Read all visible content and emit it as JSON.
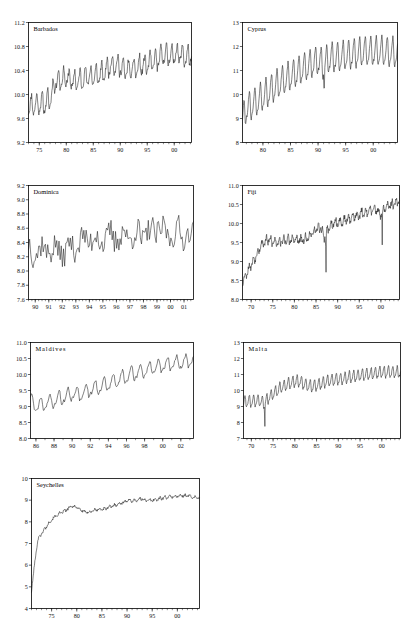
{
  "figure": {
    "title": "",
    "panel_count": 7,
    "line_color": "#1a1a1a",
    "axis_color": "#000000",
    "background": "#ffffff"
  },
  "chart_data": [
    {
      "type": "line",
      "title": "Barbados",
      "xlabel": "",
      "ylabel": "",
      "xlim": [
        73.0,
        103.2
      ],
      "ylim": [
        9.2,
        11.2
      ],
      "grid": false,
      "legend": null,
      "y_ticks": [
        "9.2",
        "9.6",
        "10.0",
        "10.4",
        "10.8",
        "11.2"
      ],
      "y_tick_values": [
        9.2,
        9.6,
        10.0,
        10.4,
        10.8,
        11.2
      ],
      "x_ticks": [
        "75",
        "80",
        "85",
        "90",
        "95",
        "00"
      ],
      "x_tick_values": [
        75,
        80,
        85,
        90,
        95,
        100
      ],
      "x_minor_step": 1,
      "series_name": "Barbados tourist arrivals (log)",
      "seasonal_period": 12,
      "points_per_unit": 12,
      "x_start": 73.0,
      "trend": [
        [
          73.0,
          9.8
        ],
        [
          74.0,
          9.82
        ],
        [
          75.0,
          9.85
        ],
        [
          76.0,
          9.84
        ],
        [
          77.0,
          9.92
        ],
        [
          78.0,
          10.22
        ],
        [
          79.0,
          10.25
        ],
        [
          80.0,
          10.28
        ],
        [
          81.0,
          10.22
        ],
        [
          82.0,
          10.22
        ],
        [
          83.0,
          10.26
        ],
        [
          84.0,
          10.3
        ],
        [
          85.0,
          10.3
        ],
        [
          86.0,
          10.32
        ],
        [
          87.0,
          10.36
        ],
        [
          88.0,
          10.48
        ],
        [
          89.0,
          10.5
        ],
        [
          90.0,
          10.46
        ],
        [
          91.0,
          10.4
        ],
        [
          92.0,
          10.42
        ],
        [
          93.0,
          10.44
        ],
        [
          94.0,
          10.48
        ],
        [
          95.0,
          10.5
        ],
        [
          96.0,
          10.54
        ],
        [
          97.0,
          10.58
        ],
        [
          98.0,
          10.66
        ],
        [
          99.0,
          10.64
        ],
        [
          100.0,
          10.66
        ],
        [
          101.0,
          10.68
        ],
        [
          102.0,
          10.62
        ],
        [
          103.2,
          10.64
        ]
      ],
      "amplitude": 0.3,
      "noise": 0.055,
      "seed": 11
    },
    {
      "type": "line",
      "title": "Cyprus",
      "xlabel": "",
      "ylabel": "",
      "xlim": [
        76.3,
        104.4
      ],
      "ylim": [
        8,
        13
      ],
      "grid": false,
      "legend": null,
      "y_ticks": [
        "8",
        "9",
        "10",
        "11",
        "12",
        "13"
      ],
      "y_tick_values": [
        8,
        9,
        10,
        11,
        12,
        13
      ],
      "x_ticks": [
        "80",
        "85",
        "90",
        "95",
        "00"
      ],
      "x_tick_values": [
        80,
        85,
        90,
        95,
        100
      ],
      "x_minor_step": 1,
      "series_name": "Cyprus tourist arrivals (log)",
      "seasonal_period": 12,
      "points_per_unit": 12,
      "x_start": 76.3,
      "trend": [
        [
          76.3,
          8.9
        ],
        [
          77.0,
          9.4
        ],
        [
          78.0,
          9.55
        ],
        [
          79.0,
          9.7
        ],
        [
          80.0,
          9.9
        ],
        [
          81.0,
          10.1
        ],
        [
          82.0,
          10.28
        ],
        [
          83.0,
          10.45
        ],
        [
          84.0,
          10.6
        ],
        [
          85.0,
          10.75
        ],
        [
          86.0,
          10.88
        ],
        [
          87.0,
          11.0
        ],
        [
          88.0,
          11.15
        ],
        [
          89.0,
          11.28
        ],
        [
          90.0,
          11.4
        ],
        [
          91.0,
          11.2
        ],
        [
          92.0,
          11.48
        ],
        [
          93.0,
          11.52
        ],
        [
          94.0,
          11.56
        ],
        [
          95.0,
          11.6
        ],
        [
          96.0,
          11.64
        ],
        [
          97.0,
          11.68
        ],
        [
          98.0,
          11.76
        ],
        [
          99.0,
          11.78
        ],
        [
          100.0,
          11.76
        ],
        [
          101.0,
          11.78
        ],
        [
          102.0,
          11.76
        ],
        [
          103.0,
          11.72
        ],
        [
          104.4,
          11.74
        ]
      ],
      "amplitude": 1.1,
      "noise": 0.05,
      "seed": 23,
      "annotations": [
        {
          "x": 91.1,
          "y": 9.7,
          "note": "1991 Gulf War dip"
        }
      ]
    },
    {
      "type": "line",
      "title": "Dominica",
      "xlabel": "",
      "ylabel": "",
      "xlim": [
        89.5,
        101.7
      ],
      "ylim": [
        7.6,
        9.2
      ],
      "grid": false,
      "legend": null,
      "y_ticks": [
        "7.6",
        "7.8",
        "8.0",
        "8.2",
        "8.4",
        "8.6",
        "8.8",
        "9.0",
        "9.2"
      ],
      "y_tick_values": [
        7.6,
        7.8,
        8.0,
        8.2,
        8.4,
        8.6,
        8.8,
        9.0,
        9.2
      ],
      "x_ticks": [
        "90",
        "91",
        "92",
        "93",
        "94",
        "95",
        "96",
        "97",
        "98",
        "99",
        "00",
        "01"
      ],
      "x_tick_values": [
        90,
        91,
        92,
        93,
        94,
        95,
        96,
        97,
        98,
        99,
        100,
        101
      ],
      "x_minor_step": 0.25,
      "series_name": "Dominica tourist arrivals (log)",
      "seasonal_period": 12,
      "points_per_unit": 12,
      "x_start": 89.5,
      "trend": [
        [
          89.5,
          8.3
        ],
        [
          90.0,
          8.28
        ],
        [
          91.0,
          8.32
        ],
        [
          92.0,
          8.26
        ],
        [
          93.0,
          8.38
        ],
        [
          94.0,
          8.46
        ],
        [
          95.0,
          8.44
        ],
        [
          96.0,
          8.48
        ],
        [
          97.0,
          8.5
        ],
        [
          98.0,
          8.5
        ],
        [
          99.0,
          8.58
        ],
        [
          100.0,
          8.52
        ],
        [
          101.7,
          8.52
        ]
      ],
      "amplitude": 0.17,
      "noise": 0.175,
      "seed": 37
    },
    {
      "type": "line",
      "title": "Fiji",
      "xlabel": "",
      "ylabel": "",
      "xlim": [
        68.0,
        104.3
      ],
      "ylim": [
        8.0,
        11.0
      ],
      "grid": false,
      "legend": null,
      "y_ticks": [
        "8.0",
        "8.5",
        "9.0",
        "9.5",
        "10.0",
        "10.5",
        "11.0"
      ],
      "y_tick_values": [
        8.0,
        8.5,
        9.0,
        9.5,
        10.0,
        10.5,
        11.0
      ],
      "x_ticks": [
        "70",
        "75",
        "80",
        "85",
        "90",
        "95",
        "00"
      ],
      "x_tick_values": [
        70,
        75,
        80,
        85,
        90,
        95,
        100
      ],
      "x_minor_step": 1,
      "series_name": "Fiji tourist arrivals (log)",
      "seasonal_period": 12,
      "points_per_unit": 12,
      "x_start": 68.0,
      "trend": [
        [
          68.0,
          8.45
        ],
        [
          69.0,
          8.72
        ],
        [
          70.0,
          8.92
        ],
        [
          71.0,
          9.12
        ],
        [
          72.0,
          9.38
        ],
        [
          73.0,
          9.52
        ],
        [
          74.0,
          9.56
        ],
        [
          75.0,
          9.52
        ],
        [
          76.0,
          9.52
        ],
        [
          77.0,
          9.54
        ],
        [
          78.0,
          9.56
        ],
        [
          79.0,
          9.56
        ],
        [
          80.0,
          9.58
        ],
        [
          81.0,
          9.56
        ],
        [
          82.0,
          9.56
        ],
        [
          83.0,
          9.62
        ],
        [
          84.0,
          9.72
        ],
        [
          85.0,
          9.82
        ],
        [
          86.0,
          9.92
        ],
        [
          87.0,
          9.62
        ],
        [
          88.0,
          9.92
        ],
        [
          89.0,
          9.98
        ],
        [
          90.0,
          10.02
        ],
        [
          91.0,
          10.04
        ],
        [
          92.0,
          10.1
        ],
        [
          93.0,
          10.14
        ],
        [
          94.0,
          10.2
        ],
        [
          95.0,
          10.24
        ],
        [
          96.0,
          10.28
        ],
        [
          97.0,
          10.32
        ],
        [
          98.0,
          10.34
        ],
        [
          99.0,
          10.38
        ],
        [
          100.0,
          10.22
        ],
        [
          101.0,
          10.42
        ],
        [
          102.0,
          10.46
        ],
        [
          103.0,
          10.52
        ],
        [
          104.3,
          10.58
        ]
      ],
      "amplitude": 0.17,
      "noise": 0.075,
      "seed": 53,
      "annotations": [
        {
          "x": 87.3,
          "y": 8.5,
          "note": "1987 coup collapse"
        },
        {
          "x": 100.3,
          "y": 9.4,
          "note": "2000 coup dip"
        }
      ]
    },
    {
      "type": "line",
      "title": "Maldives",
      "xlabel": "",
      "ylabel": "",
      "xlim": [
        85.4,
        103.4
      ],
      "ylim": [
        8.0,
        11.0
      ],
      "grid": false,
      "legend": null,
      "y_ticks": [
        "8.0",
        "8.5",
        "9.0",
        "9.5",
        "10.0",
        "10.5",
        "11.0"
      ],
      "y_tick_values": [
        8.0,
        8.5,
        9.0,
        9.5,
        10.0,
        10.5,
        11.0
      ],
      "x_ticks": [
        "86",
        "88",
        "90",
        "92",
        "94",
        "96",
        "98",
        "00",
        "02"
      ],
      "x_tick_values": [
        86,
        88,
        90,
        92,
        94,
        96,
        98,
        100,
        102
      ],
      "x_minor_step": 1,
      "series_name": "Maldives tourist arrivals (log)",
      "seasonal_period": 12,
      "points_per_unit": 12,
      "x_start": 85.4,
      "trend": [
        [
          85.4,
          9.2
        ],
        [
          86.0,
          9.0
        ],
        [
          87.0,
          9.08
        ],
        [
          88.0,
          9.18
        ],
        [
          89.0,
          9.28
        ],
        [
          90.0,
          9.38
        ],
        [
          91.0,
          9.4
        ],
        [
          92.0,
          9.52
        ],
        [
          93.0,
          9.62
        ],
        [
          94.0,
          9.7
        ],
        [
          95.0,
          9.82
        ],
        [
          96.0,
          9.94
        ],
        [
          97.0,
          10.04
        ],
        [
          98.0,
          10.12
        ],
        [
          99.0,
          10.2
        ],
        [
          100.0,
          10.28
        ],
        [
          101.0,
          10.34
        ],
        [
          102.0,
          10.36
        ],
        [
          103.4,
          10.46
        ]
      ],
      "amplitude": 0.4,
      "noise": 0.05,
      "seed": 71
    },
    {
      "type": "line",
      "title": "Malta",
      "xlabel": "",
      "ylabel": "",
      "xlim": [
        68.2,
        104.3
      ],
      "ylim": [
        7,
        13
      ],
      "grid": false,
      "legend": null,
      "y_ticks": [
        "7",
        "8",
        "9",
        "10",
        "11",
        "12",
        "13"
      ],
      "y_tick_values": [
        7,
        8,
        9,
        10,
        11,
        12,
        13
      ],
      "x_ticks": [
        "70",
        "75",
        "80",
        "85",
        "90",
        "95",
        "00"
      ],
      "x_tick_values": [
        70,
        75,
        80,
        85,
        90,
        95,
        100
      ],
      "x_minor_step": 1,
      "series_name": "Malta tourist arrivals (log)",
      "seasonal_period": 12,
      "points_per_unit": 12,
      "x_start": 68.2,
      "trend": [
        [
          68.2,
          9.25
        ],
        [
          69.0,
          9.3
        ],
        [
          70.0,
          9.32
        ],
        [
          71.0,
          9.34
        ],
        [
          72.0,
          9.36
        ],
        [
          73.0,
          9.2
        ],
        [
          74.0,
          9.55
        ],
        [
          75.0,
          9.78
        ],
        [
          76.0,
          10.0
        ],
        [
          77.0,
          10.2
        ],
        [
          78.0,
          10.34
        ],
        [
          79.0,
          10.46
        ],
        [
          80.0,
          10.56
        ],
        [
          81.0,
          10.58
        ],
        [
          82.0,
          10.42
        ],
        [
          83.0,
          10.3
        ],
        [
          84.0,
          10.26
        ],
        [
          85.0,
          10.32
        ],
        [
          86.0,
          10.4
        ],
        [
          87.0,
          10.52
        ],
        [
          88.0,
          10.6
        ],
        [
          89.0,
          10.66
        ],
        [
          90.0,
          10.7
        ],
        [
          91.0,
          10.72
        ],
        [
          92.0,
          10.8
        ],
        [
          93.0,
          10.84
        ],
        [
          94.0,
          10.9
        ],
        [
          95.0,
          10.94
        ],
        [
          96.0,
          10.98
        ],
        [
          97.0,
          11.02
        ],
        [
          98.0,
          11.06
        ],
        [
          99.0,
          11.1
        ],
        [
          100.0,
          11.12
        ],
        [
          101.0,
          11.14
        ],
        [
          102.0,
          11.14
        ],
        [
          103.0,
          11.12
        ],
        [
          104.3,
          11.12
        ]
      ],
      "amplitude": 0.66,
      "noise": 0.05,
      "seed": 89,
      "annotations": [
        {
          "x": 73.1,
          "y": 7.4,
          "note": "1973 trough"
        }
      ]
    },
    {
      "type": "line",
      "title": "Seychelles",
      "xlabel": "",
      "ylabel": "",
      "xlim": [
        71.0,
        104.4
      ],
      "ylim": [
        4,
        10
      ],
      "grid": false,
      "legend": null,
      "y_ticks": [
        "4",
        "5",
        "6",
        "7",
        "8",
        "9",
        "10"
      ],
      "y_tick_values": [
        4,
        5,
        6,
        7,
        8,
        9,
        10
      ],
      "x_ticks": [
        "75",
        "80",
        "85",
        "90",
        "95",
        "00"
      ],
      "x_tick_values": [
        75,
        80,
        85,
        90,
        95,
        100
      ],
      "x_minor_step": 1,
      "series_name": "Seychelles tourist arrivals (log)",
      "seasonal_period": 12,
      "points_per_unit": 12,
      "x_start": 71.0,
      "trend": [
        [
          71.0,
          4.8
        ],
        [
          71.4,
          5.6
        ],
        [
          71.8,
          6.4
        ],
        [
          72.2,
          7.1
        ],
        [
          72.6,
          7.35
        ],
        [
          73.0,
          7.45
        ],
        [
          74.0,
          7.8
        ],
        [
          75.0,
          8.1
        ],
        [
          76.0,
          8.3
        ],
        [
          77.0,
          8.42
        ],
        [
          78.0,
          8.56
        ],
        [
          79.0,
          8.72
        ],
        [
          80.0,
          8.68
        ],
        [
          81.0,
          8.52
        ],
        [
          82.0,
          8.42
        ],
        [
          83.0,
          8.5
        ],
        [
          84.0,
          8.56
        ],
        [
          85.0,
          8.58
        ],
        [
          86.0,
          8.64
        ],
        [
          87.0,
          8.72
        ],
        [
          88.0,
          8.8
        ],
        [
          89.0,
          8.88
        ],
        [
          90.0,
          8.98
        ],
        [
          91.0,
          8.98
        ],
        [
          92.0,
          9.0
        ],
        [
          93.0,
          9.06
        ],
        [
          94.0,
          8.98
        ],
        [
          95.0,
          9.0
        ],
        [
          96.0,
          9.04
        ],
        [
          97.0,
          9.1
        ],
        [
          98.0,
          9.14
        ],
        [
          99.0,
          9.16
        ],
        [
          100.0,
          9.18
        ],
        [
          101.0,
          9.2
        ],
        [
          102.0,
          9.22
        ],
        [
          103.0,
          9.14
        ],
        [
          104.4,
          9.1
        ]
      ],
      "amplitude": 0.09,
      "noise": 0.055,
      "seed": 101
    }
  ],
  "panels": [
    {
      "name": "barbados",
      "left": 28,
      "top": 22,
      "width": 163,
      "height": 120,
      "title_spaced": false
    },
    {
      "name": "cyprus",
      "left": 242,
      "top": 22,
      "width": 155,
      "height": 120,
      "title_spaced": false
    },
    {
      "name": "dominica",
      "left": 28,
      "top": 185,
      "width": 165,
      "height": 114,
      "title_spaced": false
    },
    {
      "name": "fiji",
      "left": 242,
      "top": 185,
      "width": 157,
      "height": 114,
      "title_spaced": false
    },
    {
      "name": "maldives",
      "left": 30,
      "top": 342,
      "width": 163,
      "height": 96,
      "title_spaced": true
    },
    {
      "name": "malta",
      "left": 243,
      "top": 342,
      "width": 157,
      "height": 96,
      "title_spaced": true
    },
    {
      "name": "seychelles",
      "left": 31,
      "top": 478,
      "width": 168,
      "height": 130,
      "title_spaced": false
    }
  ]
}
